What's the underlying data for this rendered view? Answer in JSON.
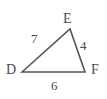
{
  "figure": {
    "name": "triangle-def",
    "background_color": "#ffffff",
    "stroke_color": "#565656",
    "text_color": "#4a4a4a",
    "vertices": [
      {
        "id": "D",
        "label": "D",
        "x": 22,
        "y": 72
      },
      {
        "id": "E",
        "label": "E",
        "x": 70,
        "y": 29
      },
      {
        "id": "F",
        "label": "F",
        "x": 85,
        "y": 72
      }
    ],
    "sides": [
      {
        "id": "DE",
        "label": "7",
        "from": "D",
        "to": "E"
      },
      {
        "id": "EF",
        "label": "4",
        "from": "E",
        "to": "F"
      },
      {
        "id": "DF",
        "label": "6",
        "from": "D",
        "to": "F"
      }
    ]
  }
}
